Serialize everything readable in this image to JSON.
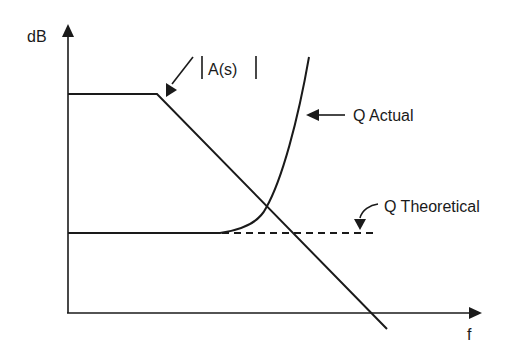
{
  "diagram": {
    "type": "bode-magnitude-sketch",
    "axes": {
      "y_label": "dB",
      "x_label": "f"
    },
    "curves": [
      {
        "id": "gain",
        "label": "|A(s)|",
        "style": "solid",
        "description": "flat at high gain, then rolls off linearly"
      },
      {
        "id": "q-actual",
        "label": "Q Actual",
        "style": "solid",
        "description": "flat at low level, then rises sharply with frequency"
      },
      {
        "id": "q-theoretical",
        "label": "Q Theoretical",
        "style": "dashed",
        "description": "stays flat at the same low level"
      }
    ],
    "labels": {
      "gain": "|A(s)|",
      "gain_text": "A(s)",
      "q_actual": "Q Actual",
      "q_theoretical": "Q Theoretical"
    },
    "colors": {
      "line": "#1a1a1a",
      "background": "#ffffff"
    }
  }
}
